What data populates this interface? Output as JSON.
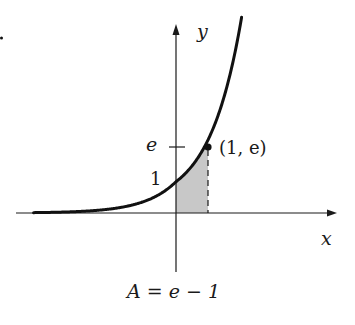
{
  "diagram": {
    "function": "e^x",
    "labels": {
      "y_axis": "y",
      "x_axis": "x",
      "e_tick": "e",
      "one_tick": "1",
      "point": "(1, e)",
      "area_caption": "A = e − 1"
    },
    "colors": {
      "ink": "#1a1a1a",
      "shade": "#c8c8c8",
      "background": "#ffffff"
    },
    "marker_stray_dot": "·"
  },
  "chart_data": {
    "type": "area",
    "title": "",
    "function": "y = e^x",
    "shaded_region": {
      "x_from": 0,
      "x_to": 1,
      "area": "e - 1"
    },
    "highlight_point": {
      "x": 1,
      "y": 2.718,
      "label": "(1, e)"
    },
    "y_ticks": [
      {
        "value": 1,
        "label": "1"
      },
      {
        "value": 2.718,
        "label": "e"
      }
    ],
    "xlabel": "x",
    "ylabel": "y",
    "caption": "A = e − 1"
  }
}
